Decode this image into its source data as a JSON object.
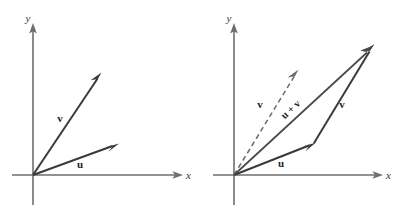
{
  "figure": {
    "background_color": "#ffffff",
    "axis_color": "#6e6e6e",
    "vector_color": "#3a3a3a",
    "dashed_vector_color": "#6a6a6a",
    "label_color": "#1d1d1d"
  },
  "panels": [
    {
      "id": "left-panel",
      "name": "two-vectors-panel",
      "origin": {
        "x": 33,
        "y": 175
      },
      "axes": {
        "x": {
          "label": "x",
          "label_x": 186,
          "label_y": 176,
          "start_x": 12,
          "end_x": 178,
          "y": 175
        },
        "y": {
          "label": "y",
          "label_x": 28,
          "label_y": 22,
          "start_y": 205,
          "end_y": 28,
          "x": 33
        }
      },
      "vectors": [
        {
          "name": "vector-v",
          "label": "v",
          "style": "solid",
          "from_x": 33,
          "from_y": 175,
          "to_x": 100,
          "to_y": 75,
          "label_x": 60,
          "label_y": 122
        },
        {
          "name": "vector-u",
          "label": "u",
          "style": "solid",
          "from_x": 33,
          "from_y": 175,
          "to_x": 116,
          "to_y": 144,
          "label_x": 80,
          "label_y": 168
        }
      ]
    },
    {
      "id": "right-panel",
      "name": "vector-sum-panel",
      "origin": {
        "x": 234,
        "y": 175
      },
      "axes": {
        "x": {
          "label": "x",
          "label_x": 386,
          "label_y": 176,
          "start_x": 213,
          "end_x": 378,
          "y": 175
        },
        "y": {
          "label": "y",
          "label_x": 229,
          "label_y": 22,
          "start_y": 205,
          "end_y": 28,
          "x": 234
        }
      },
      "vectors": [
        {
          "name": "vector-v-dashed",
          "label": "v",
          "style": "dashed",
          "from_x": 234,
          "from_y": 175,
          "to_x": 297,
          "to_y": 72,
          "label_x": 260,
          "label_y": 108
        },
        {
          "name": "vector-u",
          "label": "u",
          "style": "solid",
          "from_x": 234,
          "from_y": 175,
          "to_x": 314,
          "to_y": 143,
          "label_x": 281,
          "label_y": 167
        },
        {
          "name": "vector-v-translated",
          "label": "v",
          "style": "solid",
          "from_x": 314,
          "from_y": 143,
          "to_x": 373,
          "to_y": 46,
          "label_x": 342,
          "label_y": 108
        },
        {
          "name": "vector-u-plus-v",
          "label": "u + v",
          "style": "solid",
          "from_x": 234,
          "from_y": 175,
          "to_x": 373,
          "to_y": 46,
          "label_x": 293,
          "label_y": 112,
          "label_rotation": -43
        }
      ]
    }
  ]
}
